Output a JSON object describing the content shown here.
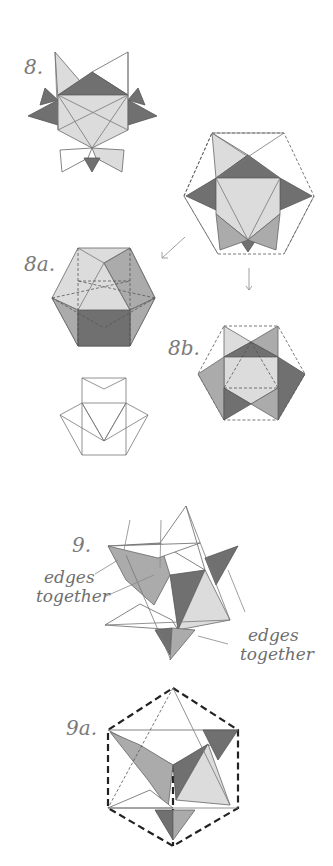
{
  "diagram": {
    "type": "origami-instructions",
    "steps": [
      {
        "id": "8",
        "label": "8."
      },
      {
        "id": "8a",
        "label": "8a."
      },
      {
        "id": "8b",
        "label": "8b."
      },
      {
        "id": "9",
        "label": "9."
      },
      {
        "id": "9a",
        "label": "9a."
      }
    ],
    "annotations": [
      {
        "id": "left-note",
        "line1": "edges",
        "line2": "together"
      },
      {
        "id": "right-note",
        "line1": "edges",
        "line2": "together"
      }
    ],
    "colors": {
      "light": "#d9d9d9",
      "mid": "#a8a8a8",
      "dark": "#6f6f6f",
      "line": "#555555",
      "background": "#ffffff"
    }
  }
}
